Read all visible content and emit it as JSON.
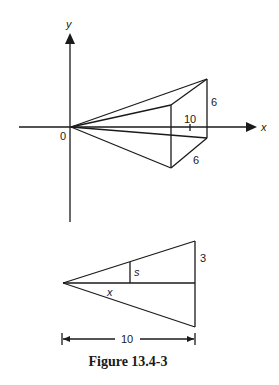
{
  "figure": {
    "caption": "Figure 13.4-3",
    "top_diagram": {
      "axis_x_label": "x",
      "axis_y_label": "y",
      "origin_label": "0",
      "tick_label": "10",
      "height_label": "6",
      "depth_label": "6"
    },
    "bottom_diagram": {
      "cross_section_label": "s",
      "distance_label": "x",
      "half_height_label": "3",
      "length_label": "10"
    }
  }
}
